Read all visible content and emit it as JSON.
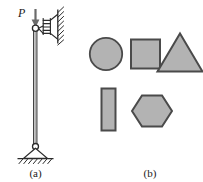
{
  "figure": {
    "width": 203,
    "height": 182,
    "background": "#ffffff",
    "stroke_color": "#2b2b2b",
    "shape_fill": "#b3b3b3",
    "shape_stroke": "#4a4a4a"
  },
  "panel_a": {
    "caption": "(a)",
    "load_label": "P",
    "elements": {
      "column": "vertical-column",
      "top_joint": "pin-hinge-circle",
      "spring": "coil-spring-to-wall",
      "wall": "hatched-vertical-wall",
      "bottom_support": "pin-support-triangle",
      "ground": "hatched-ground"
    },
    "geometry": {
      "column_x": 35,
      "column_top_y": 27,
      "column_bottom_y": 145,
      "arrow_x": 35,
      "arrow_top_y": 14,
      "arrow_tip_y": 25,
      "label_p_x": 20,
      "label_p_y": 14,
      "wall_x": 58,
      "wall_top_y": 12,
      "wall_bottom_y": 44,
      "spring_y": 26,
      "spring_x_start": 38,
      "spring_x_end": 57,
      "support_tri_half_width": 12,
      "support_tri_height": 13,
      "ground_y": 158,
      "ground_x_start": 17,
      "ground_x_end": 54,
      "caption_x": 35,
      "caption_y": 175
    }
  },
  "panel_b": {
    "caption": "(b)",
    "caption_x": 150,
    "caption_y": 175,
    "shapes": [
      {
        "name": "circle",
        "label": "circle-shape",
        "cx": 106,
        "cy": 54,
        "r": 16
      },
      {
        "name": "square",
        "label": "square-shape",
        "x": 131,
        "y": 39,
        "w": 29,
        "h": 29
      },
      {
        "name": "triangle",
        "label": "triangle-shape",
        "cx": 180,
        "top_y": 34,
        "base_y": 71,
        "half_w": 23
      },
      {
        "name": "rectangle",
        "label": "rectangle-shape",
        "x": 102,
        "y": 88,
        "w": 14,
        "h": 42
      },
      {
        "name": "hexagon",
        "label": "hexagon-shape",
        "cx": 152,
        "cy": 110,
        "rx": 20,
        "ry": 21
      }
    ]
  }
}
